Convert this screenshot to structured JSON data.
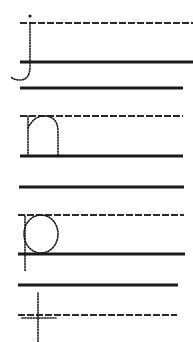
{
  "worksheet": {
    "title": "Handwriting practice: j n p t",
    "ink_color": "#1a1a1a",
    "letters": [
      {
        "char": "j",
        "style": "dotted-trace"
      },
      {
        "char": "n",
        "style": "dotted-trace"
      },
      {
        "char": "p",
        "style": "dotted-trace"
      },
      {
        "char": "t",
        "style": "dotted-trace"
      }
    ]
  }
}
